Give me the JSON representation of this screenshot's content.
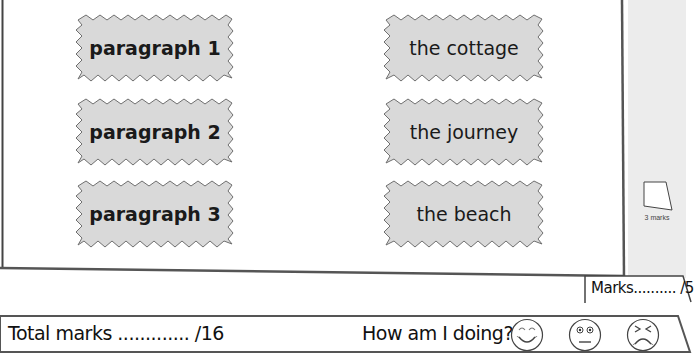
{
  "worksheet": {
    "left_cards": [
      {
        "label": "paragraph 1"
      },
      {
        "label": "paragraph 2"
      },
      {
        "label": "paragraph 3"
      }
    ],
    "right_cards": [
      {
        "label": "the cottage"
      },
      {
        "label": "the journey"
      },
      {
        "label": "the beach"
      }
    ],
    "margin": {
      "marks_label": "3 marks"
    },
    "section_marks": {
      "label": "Marks.......... /5"
    },
    "footer": {
      "total_label": "Total marks ............. /16",
      "progress_question": "How am I doing?",
      "faces": [
        {
          "name": "happy",
          "icon": "happy-face-icon"
        },
        {
          "name": "neutral",
          "icon": "neutral-face-icon"
        },
        {
          "name": "sad",
          "icon": "sad-face-icon"
        }
      ]
    },
    "colors": {
      "card_fill": "#d9d9d9",
      "card_stroke": "#6f6f6f",
      "margin_fill": "#ececec",
      "frame_stroke": "#555555"
    }
  }
}
